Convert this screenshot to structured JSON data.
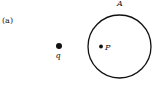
{
  "figure": {
    "panel_label": "(a)",
    "surface_label": "A",
    "charge_label": "q",
    "point_label": "P",
    "stroke_color": "#111111"
  }
}
